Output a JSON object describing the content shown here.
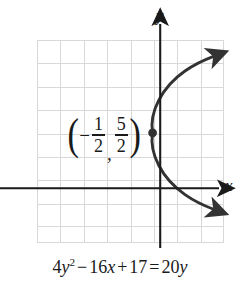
{
  "figure": {
    "type": "coordinate-graph",
    "background_color": "#ffffff",
    "grid_color": "#d8d8d8",
    "axis_color": "#1a1a1a",
    "curve_color": "#333333",
    "label_color": "#1a1a1a"
  },
  "axes": {
    "x_label": "x",
    "y_label": "y",
    "x_axis_arrow": "right-arrow-icon",
    "y_axis_arrow": "up-arrow-icon"
  },
  "grid": {
    "columns": 8,
    "rows": 9,
    "cell_size": 23.4,
    "origin_column_index": 5.25,
    "origin_row_index": 6.3
  },
  "vertex": {
    "label_open_paren": "(",
    "label_minus": "−",
    "x_numerator": "1",
    "x_denominator": "2",
    "comma": ",",
    "y_numerator": "5",
    "y_denominator": "2",
    "label_close_paren": ")",
    "marker": "point-dot"
  },
  "equation": {
    "coefficient_1": "4",
    "var_y1": "y",
    "exponent": "2",
    "op_minus": "−",
    "coefficient_2": "16",
    "var_x": "x",
    "op_plus": "+",
    "constant": "17",
    "op_equals": "=",
    "coefficient_3": "20",
    "var_y2": "y",
    "full_text": "4y² − 16x + 17 = 20y"
  },
  "curve": {
    "shape": "rightward-opening-parabola",
    "upper_branch_arrow": "arrowhead",
    "lower_branch_arrow": "arrowhead"
  }
}
